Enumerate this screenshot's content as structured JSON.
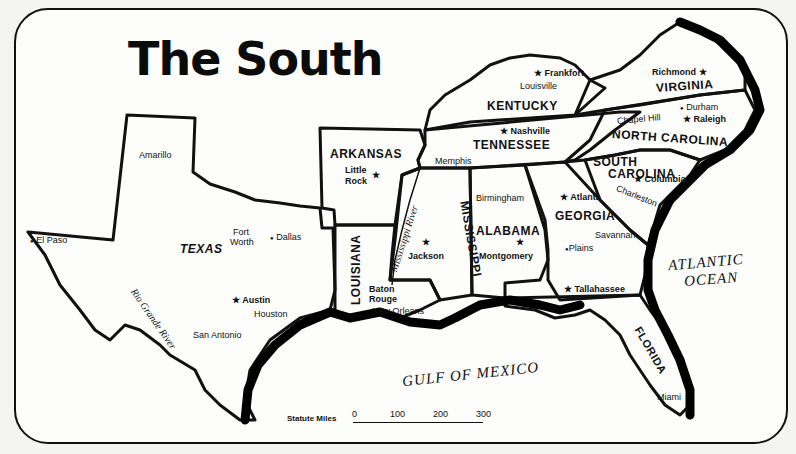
{
  "title": "The South",
  "states": {
    "texas": "TEXAS",
    "arkansas": "ARKANSAS",
    "louisiana": "LOUISIANA",
    "mississippi": "MISSISSIPPI",
    "alabama": "ALABAMA",
    "georgia": "GEORGIA",
    "florida": "FLORIDA",
    "tennessee": "TENNESSEE",
    "kentucky": "KENTUCKY",
    "virginia": "VIRGINIA",
    "north_carolina": "NORTH CAROLINA",
    "south_carolina_1": "SOUTH",
    "south_carolina_2": "CAROLINA"
  },
  "capitals": {
    "austin": "Austin",
    "little_rock_1": "Little",
    "little_rock_2": "Rock",
    "baton_rouge_1": "Baton",
    "baton_rouge_2": "Rouge",
    "jackson": "Jackson",
    "montgomery": "Montgomery",
    "atlanta": "Atlanta",
    "tallahassee": "Tallahassee",
    "nashville": "Nashville",
    "frankfort": "Frankfort",
    "richmond": "Richmond",
    "raleigh": "Raleigh",
    "columbia": "Columbia"
  },
  "cities": {
    "amarillo": "Amarillo",
    "el_paso": "El Paso",
    "fort_worth_1": "Fort",
    "fort_worth_2": "Worth",
    "dallas": "Dallas",
    "houston": "Houston",
    "san_antonio": "San Antonio",
    "new_orleans": "New Orleans",
    "memphis": "Memphis",
    "birmingham": "Birmingham",
    "plains": "Plains",
    "savannah": "Savannah",
    "charleston": "Charleston",
    "chapel_hill": "Chapel Hill",
    "durham": "Durham",
    "louisville": "Louisville",
    "miami": "Miami"
  },
  "water": {
    "atlantic_1": "ATLANTIC",
    "atlantic_2": "OCEAN",
    "gulf": "GULF OF MEXICO",
    "mississippi_river": "Mississippi River",
    "rio_grande": "Rio Grande River"
  },
  "scale": {
    "label": "Statute Miles",
    "ticks": [
      "0",
      "100",
      "200",
      "300"
    ]
  },
  "symbols": {
    "capital": "★",
    "city": "●"
  }
}
